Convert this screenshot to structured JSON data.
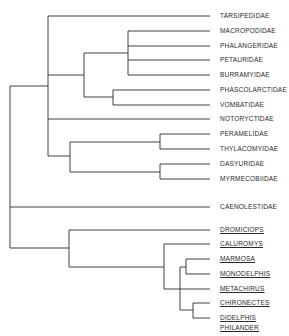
{
  "diagram": {
    "type": "phylogenetic-tree",
    "line_color": "#2b2b2b",
    "taxa": [
      {
        "label": "TARSIPEDIDAE",
        "y": 16,
        "underlined": false
      },
      {
        "label": "MACROPODIDAE",
        "y": 31,
        "underlined": false
      },
      {
        "label": "PHALANGERIDAE",
        "y": 46,
        "underlined": false
      },
      {
        "label": "PETAURIDAE",
        "y": 60,
        "underlined": false
      },
      {
        "label": "BURRAMYIDAE",
        "y": 75,
        "underlined": false
      },
      {
        "label": "PHASCOLARCTIDAE",
        "y": 90,
        "underlined": false
      },
      {
        "label": "VOMBATIDAE",
        "y": 105,
        "underlined": false
      },
      {
        "label": "NOTORYCTIDAE",
        "y": 119,
        "underlined": false
      },
      {
        "label": "PERAMELIDAE",
        "y": 134,
        "underlined": false
      },
      {
        "label": "THYLACOMYIDAE",
        "y": 149,
        "underlined": false
      },
      {
        "label": "DASYURIDAE",
        "y": 164,
        "underlined": false
      },
      {
        "label": "MYRMECOBIIDAE",
        "y": 179,
        "underlined": false
      },
      {
        "label": "CAENOLESTIDAE",
        "y": 207,
        "underlined": false
      },
      {
        "label": "DROMICIOPS",
        "y": 230,
        "underlined": true
      },
      {
        "label": "CALUROMYS",
        "y": 244,
        "underlined": true
      },
      {
        "label": "MARMOSA",
        "y": 259,
        "underlined": true
      },
      {
        "label": "MONODELPHIS",
        "y": 274,
        "underlined": true
      },
      {
        "label": "METACHIRUS",
        "y": 289,
        "underlined": true
      },
      {
        "label": "CHIRONECTES",
        "y": 303,
        "underlined": true
      },
      {
        "label": "DIDELPHIS",
        "y": 318,
        "underlined": true
      },
      {
        "label": "PHILANDER",
        "y": 328,
        "underlined": true
      }
    ]
  }
}
